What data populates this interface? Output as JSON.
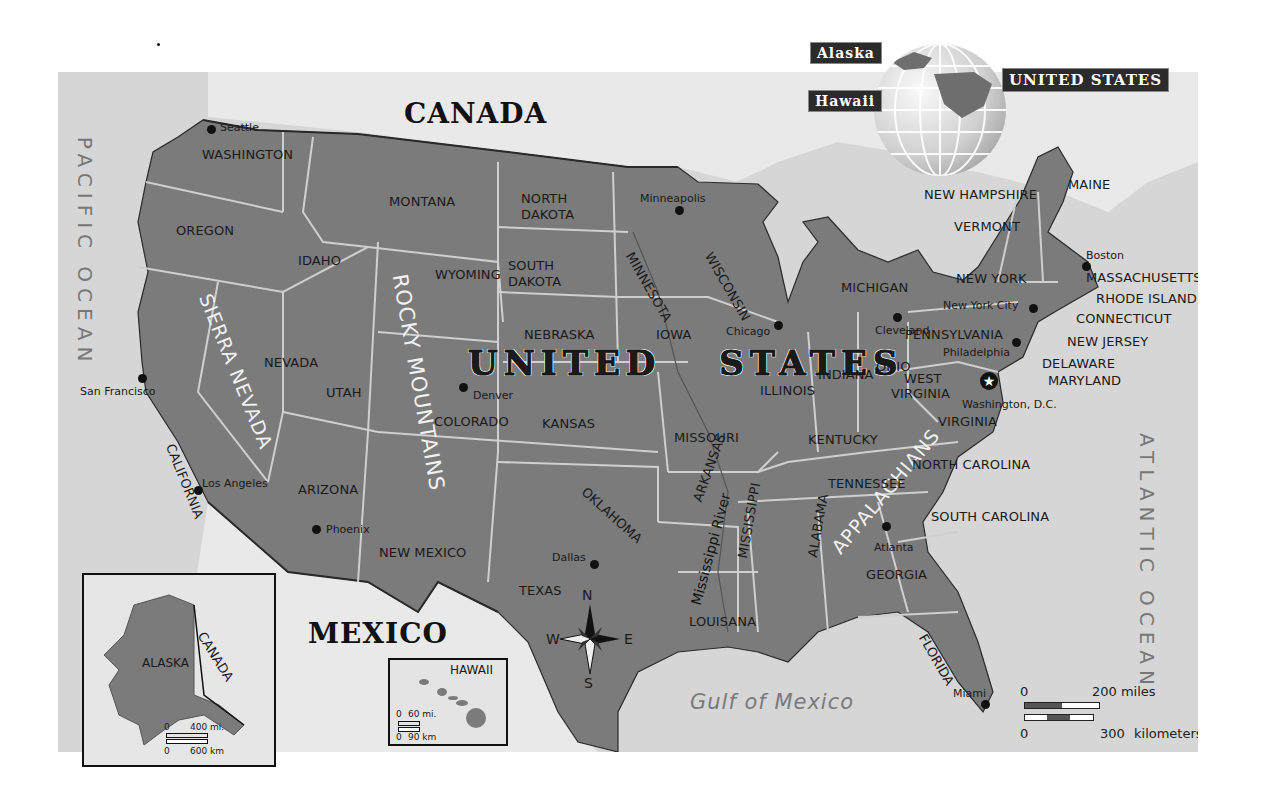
{
  "map": {
    "colors": {
      "us_fill": "#7b7b7b",
      "water": "#d6d6d6",
      "foreign_land": "#e8e8e8",
      "state_border": "#cfcfcf",
      "national_border": "#2a2a2a",
      "label_dark": "#1a1a1a",
      "ocean_label": "#777777"
    },
    "countries": {
      "canada": "CANADA",
      "mexico": "MEXICO",
      "united_states": "UNITED STATES"
    },
    "oceans": {
      "pacific": "PACIFIC OCEAN",
      "atlantic": "ATLANTIC OCEAN",
      "gulf": "Gulf of Mexico"
    },
    "mountains": {
      "rocky": "ROCKY MOUNTAINS",
      "sierra": "SIERRA NEVADA",
      "appalachians": "APPALACHIANS"
    },
    "river": "Mississippi River",
    "states": [
      {
        "name": "WASHINGTON",
        "x": 144,
        "y": 76,
        "r": 0
      },
      {
        "name": "OREGON",
        "x": 118,
        "y": 152,
        "r": 0
      },
      {
        "name": "IDAHO",
        "x": 240,
        "y": 182,
        "r": 0
      },
      {
        "name": "MONTANA",
        "x": 331,
        "y": 123,
        "r": 0
      },
      {
        "name": "WYOMING",
        "x": 377,
        "y": 196,
        "r": 0
      },
      {
        "name": "NORTH",
        "x": 463,
        "y": 120,
        "r": 0
      },
      {
        "name": "DAKOTA",
        "x": 463,
        "y": 136,
        "r": 0
      },
      {
        "name": "SOUTH",
        "x": 450,
        "y": 187,
        "r": 0
      },
      {
        "name": "DAKOTA",
        "x": 450,
        "y": 203,
        "r": 0
      },
      {
        "name": "NEBRASKA",
        "x": 466,
        "y": 256,
        "r": 0
      },
      {
        "name": "NEVADA",
        "x": 206,
        "y": 284,
        "r": 0
      },
      {
        "name": "UTAH",
        "x": 268,
        "y": 314,
        "r": 0
      },
      {
        "name": "COLORADO",
        "x": 376,
        "y": 343,
        "r": 0
      },
      {
        "name": "KANSAS",
        "x": 484,
        "y": 345,
        "r": 0
      },
      {
        "name": "IOWA",
        "x": 598,
        "y": 256,
        "r": 0
      },
      {
        "name": "MISSOURI",
        "x": 616,
        "y": 359,
        "r": 0
      },
      {
        "name": "ILLINOIS",
        "x": 702,
        "y": 312,
        "r": 0
      },
      {
        "name": "INDIANA",
        "x": 760,
        "y": 296,
        "r": 0
      },
      {
        "name": "OHIO",
        "x": 818,
        "y": 288,
        "r": 0
      },
      {
        "name": "MICHIGAN",
        "x": 783,
        "y": 209,
        "r": 0
      },
      {
        "name": "KENTUCKY",
        "x": 750,
        "y": 361,
        "r": 0
      },
      {
        "name": "TENNESSEE",
        "x": 770,
        "y": 405,
        "r": 0
      },
      {
        "name": "ARIZONA",
        "x": 240,
        "y": 411,
        "r": 0
      },
      {
        "name": "NEW MEXICO",
        "x": 321,
        "y": 474,
        "r": 0
      },
      {
        "name": "TEXAS",
        "x": 461,
        "y": 512,
        "r": 0
      },
      {
        "name": "LOUISANA",
        "x": 631,
        "y": 543,
        "r": 0
      },
      {
        "name": "GEORGIA",
        "x": 808,
        "y": 496,
        "r": 0
      },
      {
        "name": "SOUTH CAROLINA",
        "x": 873,
        "y": 438,
        "r": 0
      },
      {
        "name": "NORTH CAROLINA",
        "x": 854,
        "y": 386,
        "r": 0
      },
      {
        "name": "VIRGINIA",
        "x": 880,
        "y": 343,
        "r": 0
      },
      {
        "name": "WEST",
        "x": 846,
        "y": 300,
        "r": 0
      },
      {
        "name": "VIRGINIA",
        "x": 833,
        "y": 315,
        "r": 0
      },
      {
        "name": "PENNSYLVANIA",
        "x": 847,
        "y": 256,
        "r": 0
      },
      {
        "name": "NEW YORK",
        "x": 898,
        "y": 200,
        "r": 0
      },
      {
        "name": "VERMONT",
        "x": 896,
        "y": 148,
        "r": 0
      },
      {
        "name": "NEW HAMPSHIRE",
        "x": 866,
        "y": 116,
        "r": 0
      },
      {
        "name": "MAINE",
        "x": 1010,
        "y": 106,
        "r": 0
      },
      {
        "name": "MASSACHUSETTS",
        "x": 1028,
        "y": 199,
        "r": 0
      },
      {
        "name": "RHODE ISLAND",
        "x": 1038,
        "y": 220,
        "r": 0
      },
      {
        "name": "CONNECTICUT",
        "x": 1018,
        "y": 240,
        "r": 0
      },
      {
        "name": "NEW JERSEY",
        "x": 1009,
        "y": 263,
        "r": 0
      },
      {
        "name": "DELAWARE",
        "x": 984,
        "y": 285,
        "r": 0
      },
      {
        "name": "MARYLAND",
        "x": 990,
        "y": 302,
        "r": 0
      },
      {
        "name": "CALIFORNIA",
        "x": 118,
        "y": 370,
        "r": 68
      },
      {
        "name": "MINNESOTA",
        "x": 577,
        "y": 178,
        "r": 60
      },
      {
        "name": "WISCONSIN",
        "x": 656,
        "y": 178,
        "r": 60
      },
      {
        "name": "OKLAHOMA",
        "x": 530,
        "y": 413,
        "r": 42
      },
      {
        "name": "ARKANSAS",
        "x": 633,
        "y": 427,
        "r": -70
      },
      {
        "name": "MISSISSIPPI",
        "x": 678,
        "y": 485,
        "r": -80
      },
      {
        "name": "ALABAMA",
        "x": 748,
        "y": 484,
        "r": -80
      },
      {
        "name": "FLORIDA",
        "x": 870,
        "y": 560,
        "r": 60
      }
    ],
    "cities": [
      {
        "name": "Seattle",
        "dot": [
          153,
          57
        ],
        "x": 162,
        "y": 50
      },
      {
        "name": "Minneapolis",
        "dot": [
          621,
          138
        ],
        "x": 582,
        "y": 121
      },
      {
        "name": "Chicago",
        "dot": [
          720,
          253
        ],
        "x": 668,
        "y": 254
      },
      {
        "name": "Cleveland",
        "dot": [
          839,
          245
        ],
        "x": 817,
        "y": 253
      },
      {
        "name": "New York City",
        "dot": [
          975,
          236
        ],
        "x": 885,
        "y": 228
      },
      {
        "name": "Boston",
        "dot": [
          1028,
          194
        ],
        "x": 1028,
        "y": 178
      },
      {
        "name": "Philadelphia",
        "dot": [
          958,
          270
        ],
        "x": 885,
        "y": 275
      },
      {
        "name": "Washington, D.C.",
        "dot": [
          928,
          308
        ],
        "x": 904,
        "y": 327
      },
      {
        "name": "San Francisco",
        "dot": [
          84,
          306
        ],
        "x": 22,
        "y": 314
      },
      {
        "name": "Los Angeles",
        "dot": [
          140,
          418
        ],
        "x": 144,
        "y": 406
      },
      {
        "name": "Denver",
        "dot": [
          405,
          315
        ],
        "x": 415,
        "y": 318
      },
      {
        "name": "Phoenix",
        "dot": [
          258,
          457
        ],
        "x": 268,
        "y": 452
      },
      {
        "name": "Dallas",
        "dot": [
          536,
          492
        ],
        "x": 494,
        "y": 480
      },
      {
        "name": "Atlanta",
        "dot": [
          828,
          454
        ],
        "x": 816,
        "y": 470
      },
      {
        "name": "Miami",
        "dot": [
          927,
          632
        ],
        "x": 895,
        "y": 616
      }
    ],
    "compass": {
      "n": "N",
      "s": "S",
      "e": "E",
      "w": "W"
    },
    "scale": {
      "miles_start": "0",
      "miles_end": "200 miles",
      "km_start": "0",
      "km_end": "300",
      "km_unit": "kilometers"
    },
    "locator_globe": {
      "alaska": "Alaska",
      "hawaii": "Hawaii",
      "united_states": "UNITED STATES"
    },
    "inset_alaska": {
      "state": "ALASKA",
      "country": "CANADA",
      "scale_mi_start": "0",
      "scale_mi_end": "400 mi.",
      "scale_km_start": "0",
      "scale_km_end": "600 km"
    },
    "inset_hawaii": {
      "state": "HAWAII",
      "scale_mi_start": "0",
      "scale_mi_end": "60 mi.",
      "scale_km_start": "0",
      "scale_km_end": "90 km"
    }
  }
}
